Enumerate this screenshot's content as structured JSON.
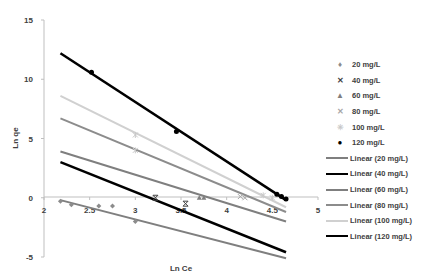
{
  "chart_data": {
    "type": "scatter",
    "title": "",
    "xlabel": "Ln Ce",
    "ylabel": "Ln qe",
    "xlim": [
      2,
      5
    ],
    "ylim": [
      -5,
      15
    ],
    "x_ticks": [
      "2",
      "2.5",
      "3",
      "3.5",
      "4",
      "4.5",
      "5"
    ],
    "y_ticks": [
      "15",
      "10",
      "5",
      "0",
      "-5"
    ],
    "grid": false,
    "legend_position": "right",
    "series": [
      {
        "name": "20 mg/L",
        "marker": "diamond",
        "color": "#8c8c8c",
        "points": [
          [
            2.18,
            -0.3
          ],
          [
            2.3,
            -0.6
          ],
          [
            2.6,
            -0.7
          ],
          [
            2.75,
            -0.7
          ],
          [
            3.0,
            -2.0
          ]
        ]
      },
      {
        "name": "40 mg/L",
        "marker": "x-bar",
        "color": "#404040",
        "points": [
          [
            3.22,
            0.0
          ],
          [
            3.55,
            -0.5
          ]
        ]
      },
      {
        "name": "60 mg/L",
        "marker": "triangle",
        "color": "#7f7f7f",
        "points": [
          [
            3.7,
            0.0
          ],
          [
            3.75,
            0.0
          ]
        ]
      },
      {
        "name": "80 mg/L",
        "marker": "x",
        "color": "#a6a6a6",
        "points": [
          [
            4.15,
            0.1
          ],
          [
            4.2,
            0.0
          ]
        ]
      },
      {
        "name": "100 mg/L",
        "marker": "star",
        "color": "#c8c8c8",
        "points": [
          [
            3.0,
            5.3
          ],
          [
            3.0,
            4.0
          ],
          [
            4.4,
            0.2
          ],
          [
            4.5,
            0.0
          ]
        ]
      },
      {
        "name": "120 mg/L",
        "marker": "circle",
        "color": "#000000",
        "points": [
          [
            2.52,
            10.6
          ],
          [
            3.45,
            5.6
          ],
          [
            4.55,
            0.3
          ],
          [
            4.6,
            0.1
          ],
          [
            4.65,
            -0.1
          ]
        ]
      }
    ],
    "trendlines": [
      {
        "name": "Linear (20 mg/L)",
        "color": "#7f7f7f",
        "x": [
          2.18,
          4.65
        ],
        "y": [
          -0.2,
          -5.1
        ]
      },
      {
        "name": "Linear (40 mg/L)",
        "color": "#000000",
        "x": [
          2.18,
          4.65
        ],
        "y": [
          3.0,
          -4.6
        ]
      },
      {
        "name": "Linear (60 mg/L)",
        "color": "#7f7f7f",
        "x": [
          2.18,
          4.65
        ],
        "y": [
          3.9,
          -2.0
        ]
      },
      {
        "name": "Linear (80 mg/L)",
        "color": "#8c8c8c",
        "x": [
          2.18,
          4.65
        ],
        "y": [
          6.7,
          -1.2
        ]
      },
      {
        "name": "Linear (100 mg/L)",
        "color": "#d0d0d0",
        "x": [
          2.18,
          4.65
        ],
        "y": [
          8.6,
          -0.8
        ]
      },
      {
        "name": "Linear (120 mg/L)",
        "color": "#000000",
        "x": [
          2.18,
          4.65
        ],
        "y": [
          12.2,
          -0.2
        ]
      }
    ]
  },
  "legend": {
    "markers": [
      {
        "label": "20 mg/L",
        "symbol": "♦",
        "color": "#8c8c8c"
      },
      {
        "label": "40 mg/L",
        "symbol": "✕",
        "color": "#404040"
      },
      {
        "label": "60 mg/L",
        "symbol": "▲",
        "color": "#7f7f7f"
      },
      {
        "label": "80 mg/L",
        "symbol": "✕",
        "color": "#a6a6a6"
      },
      {
        "label": "100 mg/L",
        "symbol": "✳",
        "color": "#c8c8c8"
      },
      {
        "label": "120 mg/L",
        "symbol": "●",
        "color": "#000000"
      }
    ],
    "lines": [
      {
        "label": "Linear (20 mg/L)",
        "color": "#7f7f7f",
        "width": 2
      },
      {
        "label": "Linear (40 mg/L)",
        "color": "#000000",
        "width": 2.5
      },
      {
        "label": "Linear (60 mg/L)",
        "color": "#7f7f7f",
        "width": 2
      },
      {
        "label": "Linear (80 mg/L)",
        "color": "#8c8c8c",
        "width": 2
      },
      {
        "label": "Linear (100 mg/L)",
        "color": "#d0d0d0",
        "width": 2
      },
      {
        "label": "Linear (120 mg/L)",
        "color": "#000000",
        "width": 2.5
      }
    ]
  }
}
